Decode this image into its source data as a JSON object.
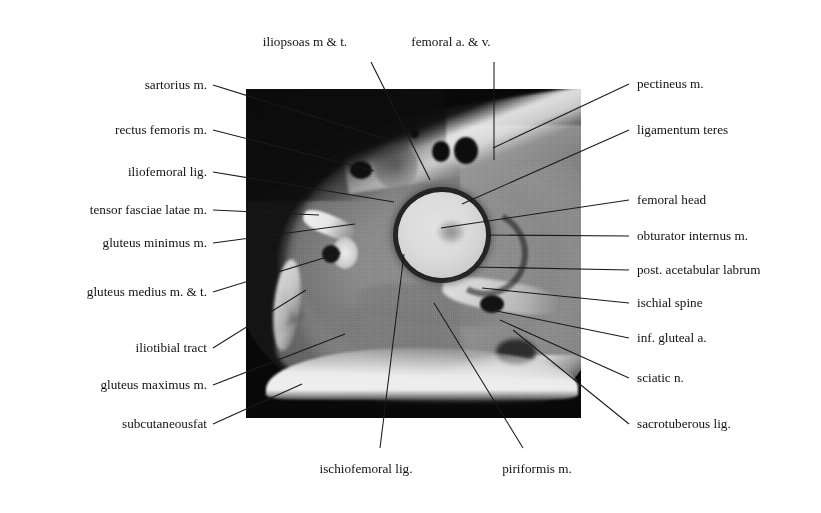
{
  "figure": {
    "type": "axial MRI of the hip with anatomical leader-line labels",
    "canvas": {
      "width": 821,
      "height": 513,
      "background": "#ffffff"
    },
    "image_region": {
      "x": 246,
      "y": 89,
      "width": 335,
      "height": 329,
      "modality": "MRI",
      "plane": "axial",
      "region": "hip"
    }
  },
  "labels": {
    "top": [
      {
        "id": "iliopsoas",
        "text": "iliopsoas m & t.",
        "tx": 305,
        "ty": 42,
        "lx": 371,
        "ly": 62,
        "ex": 430,
        "ey": 180
      },
      {
        "id": "femoral-vessels",
        "text": "femoral a. & v.",
        "tx": 451,
        "ty": 42,
        "lx": 494,
        "ly": 62,
        "ex": 494,
        "ey": 160
      }
    ],
    "left": [
      {
        "id": "sartorius",
        "text": "sartorius m.",
        "tx": 207,
        "ty": 85,
        "ex": 383,
        "ey": 138
      },
      {
        "id": "rectus-femoris",
        "text": "rectus femoris m.",
        "tx": 207,
        "ty": 130,
        "ex": 374,
        "ey": 171
      },
      {
        "id": "iliofemoral",
        "text": "iliofemoral lig.",
        "tx": 207,
        "ty": 172,
        "ex": 394,
        "ey": 202
      },
      {
        "id": "tfl",
        "text": "tensor fasciae latae m.",
        "tx": 207,
        "ty": 210,
        "ex": 319,
        "ey": 215
      },
      {
        "id": "gluteus-minimus",
        "text": "gluteus minimus m.",
        "tx": 207,
        "ty": 243,
        "ex": 355,
        "ey": 224
      },
      {
        "id": "gluteus-medius",
        "text": "gluteus medius m. & t.",
        "tx": 207,
        "ty": 292,
        "ex": 340,
        "ey": 253
      },
      {
        "id": "iliotibial",
        "text": "iliotibial tract",
        "tx": 207,
        "ty": 348,
        "ex": 306,
        "ey": 290
      },
      {
        "id": "gluteus-maximus",
        "text": "gluteus maximus m.",
        "tx": 207,
        "ty": 385,
        "ex": 345,
        "ey": 334
      },
      {
        "id": "subcutaneous",
        "text": "subcutaneousfat",
        "tx": 207,
        "ty": 424,
        "ex": 302,
        "ey": 384
      }
    ],
    "right": [
      {
        "id": "pectineus",
        "text": "pectineus m.",
        "tx": 637,
        "ty": 84,
        "ex": 493,
        "ey": 148
      },
      {
        "id": "ligamentum-teres",
        "text": "ligamentum teres",
        "tx": 637,
        "ty": 130,
        "ex": 462,
        "ey": 204
      },
      {
        "id": "femoral-head",
        "text": "femoral head",
        "tx": 637,
        "ty": 200,
        "ex": 441,
        "ey": 228
      },
      {
        "id": "obturator",
        "text": "obturator internus m.",
        "tx": 637,
        "ty": 236,
        "ex": 487,
        "ey": 235
      },
      {
        "id": "labrum",
        "text": "post. acetabular labrum",
        "tx": 637,
        "ty": 270,
        "ex": 475,
        "ey": 267
      },
      {
        "id": "ischial-spine",
        "text": "ischial spine",
        "tx": 637,
        "ty": 303,
        "ex": 482,
        "ey": 288
      },
      {
        "id": "inf-gluteal",
        "text": "inf. gluteal a.",
        "tx": 637,
        "ty": 338,
        "ex": 487,
        "ey": 309
      },
      {
        "id": "sciatic",
        "text": "sciatic n.",
        "tx": 637,
        "ty": 378,
        "ex": 500,
        "ey": 320
      },
      {
        "id": "sacrotuberous",
        "text": "sacrotuberous lig.",
        "tx": 637,
        "ty": 424,
        "ex": 513,
        "ey": 330
      }
    ],
    "bottom": [
      {
        "id": "ischiofemoral",
        "text": "ischiofemoral lig.",
        "tx": 366,
        "ty": 469,
        "lx": 380,
        "ly": 448,
        "ex": 404,
        "ey": 254
      },
      {
        "id": "piriformis",
        "text": "piriformis m.",
        "tx": 537,
        "ty": 469,
        "lx": 523,
        "ly": 448,
        "ex": 434,
        "ey": 303
      }
    ]
  },
  "style": {
    "text_color": "#111111",
    "leader_color": "#1a1a1a",
    "font_size_px": 13.2
  }
}
